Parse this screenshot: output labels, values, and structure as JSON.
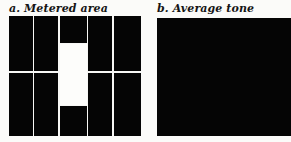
{
  "figure": {
    "panels": [
      {
        "id": "a",
        "marker": "a.",
        "label": "Metered area",
        "caption": "a. Metered area",
        "type": "metering-grid",
        "columns": 5,
        "rows": 2,
        "dark_color": "#050505",
        "lit_color": "#fdfdfb",
        "gutter_color": "#f7f7f5",
        "description": "Grid of dark rectangles with a vertical light band through the centre column"
      },
      {
        "id": "b",
        "marker": "b.",
        "label": "Average tone",
        "caption": "b. Average tone",
        "type": "solid-tone",
        "tone_color": "#050505",
        "description": "Uniform dark rectangle representing the averaged tone"
      }
    ],
    "background_color": "#fbfbf9"
  }
}
